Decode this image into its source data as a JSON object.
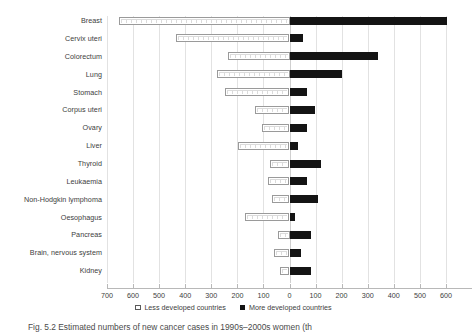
{
  "chart_data": {
    "type": "bar",
    "orientation": "horizontal",
    "subtype": "diverging-population-pyramid",
    "title": "",
    "xlabel": "",
    "ylabel": "",
    "grid": true,
    "legend_position": "bottom-center",
    "axis_ticks_left": [
      700,
      600,
      500,
      400,
      300,
      200,
      100,
      0
    ],
    "axis_ticks_right": [
      100,
      200,
      300,
      400,
      500,
      600,
      700
    ],
    "axis_tick_labels": [
      "700",
      "600",
      "500",
      "400",
      "300",
      "200",
      "100",
      "0",
      "100",
      "200",
      "300",
      "400",
      "500",
      "600",
      "700"
    ],
    "xlim": [
      -700,
      700
    ],
    "categories": [
      "Breast",
      "Cervix uteri",
      "Colorectum",
      "Lung",
      "Stomach",
      "Corpus uteri",
      "Ovary",
      "Liver",
      "Thyroid",
      "Leukaemia",
      "Non-Hodgkin lymphoma",
      "Oesophagus",
      "Pancreas",
      "Brain, nervous system",
      "Kidney"
    ],
    "series": [
      {
        "name": "Less developed countries",
        "direction": "left",
        "style": "open-white",
        "values": [
          654,
          435,
          236,
          278,
          247,
          132,
          106,
          198,
          76,
          84,
          66,
          170,
          44,
          58,
          36
        ]
      },
      {
        "name": "More developed countries",
        "direction": "right",
        "style": "solid-black",
        "values": [
          604,
          52,
          338,
          202,
          67,
          98,
          68,
          32,
          122,
          68,
          110,
          22,
          84,
          44,
          82
        ]
      }
    ],
    "colors": {
      "less_developed": "#ffffff",
      "less_developed_border": "#9a9a9a",
      "more_developed": "#141414",
      "gridline": "#e2e2e2",
      "axis": "#b8b8b8",
      "text": "#3d3d3d"
    }
  },
  "legend": {
    "items": [
      {
        "label": "Less developed countries",
        "swatch": "open-square-swatch"
      },
      {
        "label": "More developed countries",
        "swatch": "filled-square-swatch"
      }
    ]
  },
  "caption": {
    "text": "Fig. 5.2  Estimated numbers of new cancer cases in 1990s–2000s  women (th"
  }
}
